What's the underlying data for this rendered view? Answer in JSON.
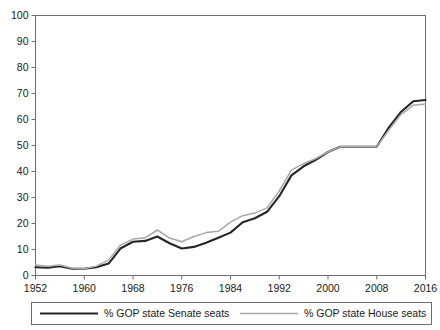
{
  "chart_data": {
    "type": "line",
    "title": "",
    "subtitle": "",
    "xlabel": "",
    "ylabel": "",
    "xlim": [
      1952,
      2016
    ],
    "ylim": [
      0,
      100
    ],
    "grid": false,
    "legend_position": "bottom",
    "x_ticks": [
      1952,
      1960,
      1968,
      1976,
      1984,
      1992,
      2000,
      2008,
      2016
    ],
    "y_ticks": [
      0,
      10,
      20,
      30,
      40,
      50,
      60,
      70,
      80,
      90,
      100
    ],
    "x": [
      1952,
      1954,
      1956,
      1958,
      1960,
      1962,
      1964,
      1966,
      1968,
      1970,
      1972,
      1974,
      1976,
      1978,
      1980,
      1982,
      1984,
      1986,
      1988,
      1990,
      1992,
      1994,
      1996,
      1998,
      2000,
      2002,
      2004,
      2006,
      2008,
      2010,
      2012,
      2014,
      2016
    ],
    "series": [
      {
        "name": "% GOP state Senate seats",
        "color": "#262626",
        "width": 2.1,
        "values": [
          3.2,
          3.0,
          3.6,
          2.6,
          2.6,
          3.2,
          4.6,
          10.5,
          13.0,
          13.3,
          15.0,
          12.4,
          10.4,
          11.0,
          12.6,
          14.5,
          16.5,
          20.5,
          22.0,
          24.5,
          30.5,
          38.5,
          42.0,
          44.5,
          47.5,
          49.5,
          49.5,
          49.5,
          49.5,
          57.0,
          63.0,
          67.0,
          67.5
        ]
      },
      {
        "name": "% GOP state House seats",
        "color": "#a8a8a8",
        "width": 1.5,
        "values": [
          4.0,
          3.6,
          4.0,
          2.8,
          2.6,
          3.6,
          6.0,
          11.8,
          14.0,
          14.5,
          17.5,
          14.4,
          13.0,
          15.0,
          16.5,
          17.0,
          20.5,
          23.0,
          24.0,
          26.0,
          32.5,
          40.5,
          43.0,
          45.0,
          47.5,
          49.5,
          49.5,
          49.5,
          49.5,
          56.0,
          62.0,
          65.5,
          66.0
        ]
      }
    ]
  },
  "legend": {
    "entries": [
      {
        "label": "% GOP state Senate seats"
      },
      {
        "label": "% GOP state House seats"
      }
    ]
  },
  "axes": {
    "y_tick_labels": [
      "0",
      "10",
      "20",
      "30",
      "40",
      "50",
      "60",
      "70",
      "80",
      "90",
      "100"
    ],
    "x_tick_labels": [
      "1952",
      "1960",
      "1968",
      "1976",
      "1984",
      "1992",
      "2000",
      "2008",
      "2016"
    ]
  }
}
